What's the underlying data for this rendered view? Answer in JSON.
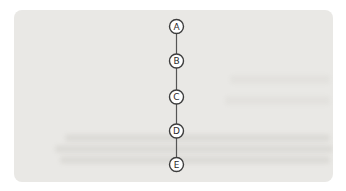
{
  "figure": {
    "type": "diagram",
    "nodes": [
      {
        "label": "A"
      },
      {
        "label": "B"
      },
      {
        "label": "C"
      },
      {
        "label": "D"
      },
      {
        "label": "E"
      }
    ],
    "edges": [
      [
        "A",
        "B"
      ],
      [
        "B",
        "C"
      ],
      [
        "C",
        "D"
      ],
      [
        "D",
        "E"
      ]
    ],
    "colors": {
      "page_background": "#ffffff",
      "panel_background": "#e9e8e5",
      "node_fill": "#ffffff",
      "node_stroke": "#3d3d3d",
      "label_color": "#2b2b2b",
      "edge_color": "#555555"
    }
  }
}
